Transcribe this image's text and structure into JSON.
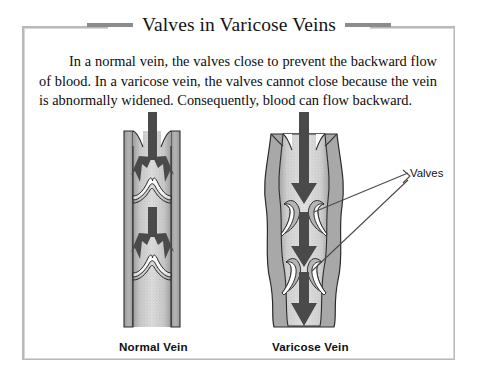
{
  "figure": {
    "title": "Valves in Varicose Veins",
    "body_text": "In a normal vein, the valves close to prevent the backward flow of blood. In a varicose vein, the valves cannot close because the vein is abnormally widened. Consequently, blood can flow backward.",
    "panels": [
      {
        "id": "normal",
        "caption": "Normal Vein",
        "description": "Narrow straight vein with two valve pairs closed across the lumen; arrows split outward against the closed cusps showing blocked backflow.",
        "valve_count": 2,
        "valve_state": "closed",
        "vessel_shape": "narrow-straight"
      },
      {
        "id": "varicose",
        "caption": "Varicose Vein",
        "description": "Abnormally widened bulging vein with valve cusps pressed against the walls and unable to meet; three large arrows flow straight downward.",
        "valve_count": 2,
        "valve_state": "open-incompetent",
        "vessel_shape": "dilated-bulging",
        "arrow_count": 3
      }
    ],
    "callout": {
      "label": "Valves",
      "leader_line_count": 2
    },
    "colors": {
      "frame": "#b9b9b9",
      "frame_inner": "#d8d8d8",
      "title_rule": "#8c8c8c",
      "title_text": "#141414",
      "body_text": "#0d0d0d",
      "vessel_wall": "#a8a8a8",
      "vessel_wall_dark": "#8e8e8e",
      "vessel_lumen": "#d2d2d2",
      "vessel_outline": "#2b2b2b",
      "valve_cusp": "#ffffff",
      "arrow": "#4a4a4a",
      "leader_line": "#4a4a4a",
      "background": "#ffffff"
    }
  }
}
